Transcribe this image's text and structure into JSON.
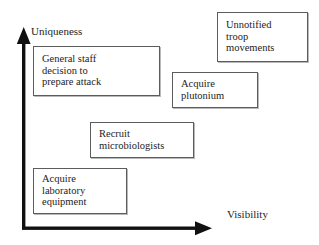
{
  "diagram": {
    "type": "two-axis-positioning-matrix",
    "background_color": "#ffffff",
    "axes": {
      "y_axis_label": "Uniqueness",
      "x_axis_label": "Visibility",
      "axis_color": "#111111",
      "origin_px": [
        23,
        228
      ],
      "y_axis_top_px": [
        23,
        28
      ],
      "x_axis_right_px": [
        212,
        228
      ]
    },
    "boxes": [
      {
        "id": "general-staff",
        "text": "General staff\ndecision to\nprepare attack",
        "uniqueness": "high",
        "visibility": "low",
        "rect_px": [
          33,
          46,
          127,
          50
        ]
      },
      {
        "id": "unnotified-troop-movements",
        "text": "Unnotified\ntroop\nmovements",
        "uniqueness": "highest",
        "visibility": "highest",
        "rect_px": [
          217,
          12,
          91,
          50
        ]
      },
      {
        "id": "acquire-plutonium",
        "text": "Acquire\nplutonium",
        "uniqueness": "high",
        "visibility": "medium-high",
        "rect_px": [
          172,
          72,
          86,
          36
        ]
      },
      {
        "id": "recruit-microbiologists",
        "text": "Recruit\nmicrobiologists",
        "uniqueness": "medium",
        "visibility": "medium",
        "rect_px": [
          90,
          122,
          104,
          36
        ]
      },
      {
        "id": "acquire-laboratory-equipment",
        "text": "Acquire\nlaboratory\nequipment",
        "uniqueness": "low",
        "visibility": "low",
        "rect_px": [
          33,
          168,
          94,
          46
        ]
      }
    ]
  }
}
